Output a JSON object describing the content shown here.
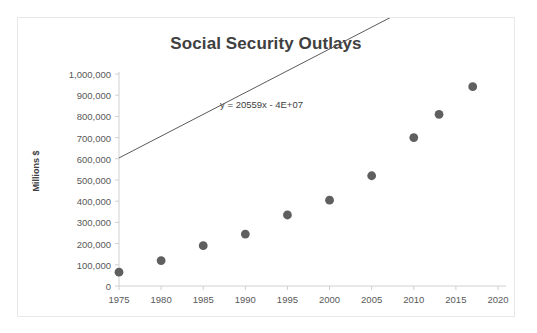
{
  "chart_data": {
    "type": "scatter",
    "title": "Social Security Outlays",
    "xlabel": "",
    "ylabel": "Millions $",
    "xlim": [
      1975,
      2020
    ],
    "ylim": [
      0,
      1000000
    ],
    "grid": false,
    "legend": "none",
    "x_ticks": [
      "1975",
      "1980",
      "1985",
      "1990",
      "1995",
      "2000",
      "2005",
      "2010",
      "2015",
      "2020"
    ],
    "y_ticks": [
      "0",
      "100,000",
      "200,000",
      "300,000",
      "400,000",
      "500,000",
      "600,000",
      "700,000",
      "800,000",
      "900,000",
      "1,000,000"
    ],
    "x": [
      1975,
      1980,
      1985,
      1990,
      1995,
      2000,
      2005,
      2010,
      2013,
      2017
    ],
    "values": [
      65000,
      120000,
      190000,
      245000,
      335000,
      405000,
      520000,
      700000,
      810000,
      940000
    ],
    "annotations": [
      {
        "text": "y = 20559x - 4E+07",
        "x": 1987,
        "y": 855000
      }
    ],
    "trendline": {
      "equation": "y = 20559x - 4E+07",
      "slope": 20559,
      "intercept": -40000000,
      "x_start": 1975,
      "x_end": 2019
    },
    "colors": {
      "marker": "#5f5f5f",
      "trendline": "#5a5a5a",
      "axis": "#d0d0d0",
      "title_text": "#404040",
      "tick_text": "#595959",
      "border": "#e8e8e8",
      "background": "#ffffff"
    }
  }
}
